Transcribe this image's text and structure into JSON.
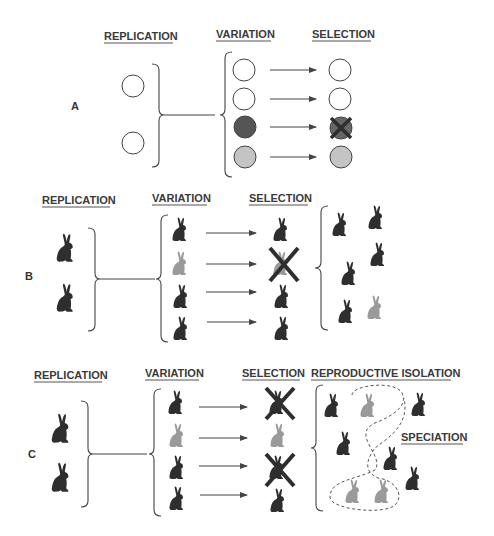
{
  "colors": {
    "dark": "#2e2e2e",
    "light": "#9a9a9a",
    "circle_dark": "#555555",
    "circle_light": "#c4c4c4",
    "line": "#444444"
  },
  "panel_a": {
    "label": "A",
    "headers": {
      "replication": "REPLICATION",
      "variation": "VARIATION",
      "selection": "SELECTION"
    },
    "replication": [
      "white",
      "white"
    ],
    "variation": [
      "white",
      "white",
      "dark",
      "light"
    ],
    "selection": [
      {
        "fill": "white",
        "eliminated": false
      },
      {
        "fill": "white",
        "eliminated": false
      },
      {
        "fill": "dark",
        "eliminated": true
      },
      {
        "fill": "light",
        "eliminated": false
      }
    ]
  },
  "panel_b": {
    "label": "B",
    "headers": {
      "replication": "REPLICATION",
      "variation": "VARIATION",
      "selection": "SELECTION"
    },
    "replication": [
      "dark",
      "dark"
    ],
    "variation": [
      "dark",
      "light",
      "dark",
      "dark"
    ],
    "selection": [
      {
        "fill": "dark",
        "eliminated": false
      },
      {
        "fill": "light",
        "eliminated": true
      },
      {
        "fill": "dark",
        "eliminated": false
      },
      {
        "fill": "dark",
        "eliminated": false
      }
    ],
    "offspring": [
      "dark",
      "dark",
      "dark",
      "dark",
      "dark",
      "light"
    ]
  },
  "panel_c": {
    "label": "C",
    "headers": {
      "replication": "REPLICATION",
      "variation": "VARIATION",
      "selection": "SELECTION",
      "isolation": "REPRODUCTIVE ISOLATION"
    },
    "replication": [
      "dark",
      "dark"
    ],
    "variation": [
      "dark",
      "light",
      "dark",
      "dark"
    ],
    "selection": [
      {
        "fill": "dark",
        "eliminated": true
      },
      {
        "fill": "light",
        "eliminated": false
      },
      {
        "fill": "dark",
        "eliminated": true
      },
      {
        "fill": "dark",
        "eliminated": false
      }
    ],
    "offspring": [
      "dark",
      "light",
      "dark",
      "dark",
      "dark",
      "light",
      "light",
      "dark"
    ],
    "speciation_label": "SPECIATION"
  }
}
